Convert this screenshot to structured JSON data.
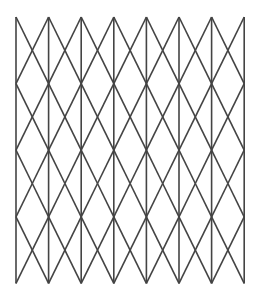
{
  "figure": {
    "type": "geometric-pattern",
    "background_color": "#ffffff",
    "line_color": "#444444",
    "line_width": 1.6,
    "line_cap": "butt"
  },
  "chart_data": {
    "type": "diagram",
    "subtitle": "",
    "xlabel": "",
    "ylabel": "",
    "grid": true,
    "legend": null,
    "annotations": [],
    "geometry": {
      "pattern": "triangular-isometric-lattice",
      "columns": 8,
      "rows": 8,
      "x_origin": 16,
      "y_origin": 17,
      "column_spacing": 32.6,
      "row_spacing": 33.3,
      "half_column": 16.3,
      "x_positions": [
        16,
        48.6,
        81.2,
        113.8,
        146.4,
        179,
        211.6,
        244.2
      ],
      "y_positions": [
        17,
        50.3,
        83.6,
        116.9,
        150.2,
        183.5,
        216.8,
        250.1,
        283.4
      ],
      "vertical_line_count": 8,
      "diagonal_direction_count": 2,
      "description": "Vertical lines spaced evenly, crossed by two families of diagonals forming equilateral-style triangles; apexes alternate up and down between successive rows."
    }
  }
}
